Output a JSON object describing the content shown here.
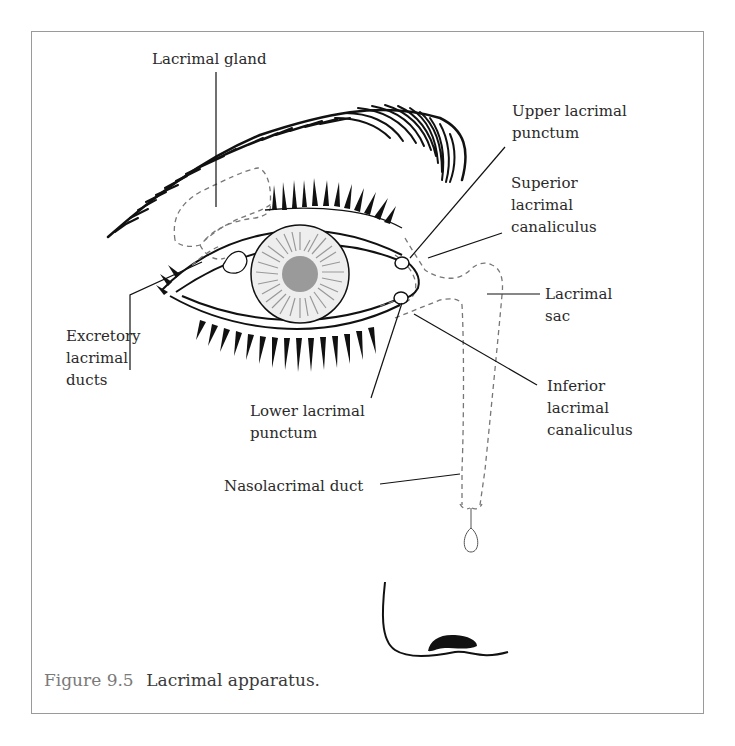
{
  "figure": {
    "number_label": "Figure 9.5",
    "title": "Lacrimal apparatus."
  },
  "labels": {
    "lacrimal_gland": "Lacrimal gland",
    "upper_lacrimal_punctum": "Upper lacrimal\npunctum",
    "superior_lacrimal_canaliculus": "Superior\nlacrimal\ncanaliculus",
    "lacrimal_sac": "Lacrimal\nsac",
    "excretory_lacrimal_ducts": "Excretory\nlacrimal\nducts",
    "inferior_lacrimal_canaliculus": "Inferior\nlacrimal\ncanaliculus",
    "lower_lacrimal_punctum": "Lower lacrimal\npunctum",
    "nasolacrimal_duct": "Nasolacrimal duct"
  },
  "colors": {
    "line": "#111111",
    "dashed_structure": "#777777",
    "iris_fill": "#eeeeee",
    "iris_veins": "#999999",
    "pupil": "#9a9a9a",
    "frame_border": "#9a9a9a",
    "caption_figure_number": "#7a7a7a",
    "caption_text": "#3a3a3a"
  }
}
